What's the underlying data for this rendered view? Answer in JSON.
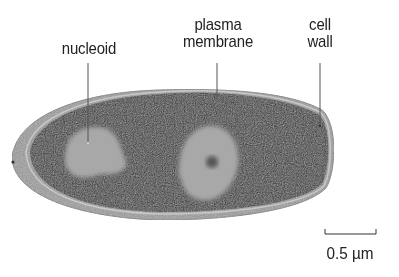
{
  "figure": {
    "type": "electron micrograph diagram of a bacterial cell",
    "labels": [
      {
        "id": "nucleoid",
        "lines": [
          "nucleoid"
        ]
      },
      {
        "id": "plasma-membrane",
        "lines": [
          "plasma",
          "membrane"
        ]
      },
      {
        "id": "cell-wall",
        "lines": [
          "cell",
          "wall"
        ]
      }
    ],
    "scale_bar": {
      "label": "0.5 µm"
    },
    "colors": {
      "cytoplasm": "#2a2a2a",
      "nucleoid": "#a8a8a8",
      "cell_wall": "#9a9a9a",
      "label_text": "#222222",
      "background": "#ffffff"
    }
  }
}
